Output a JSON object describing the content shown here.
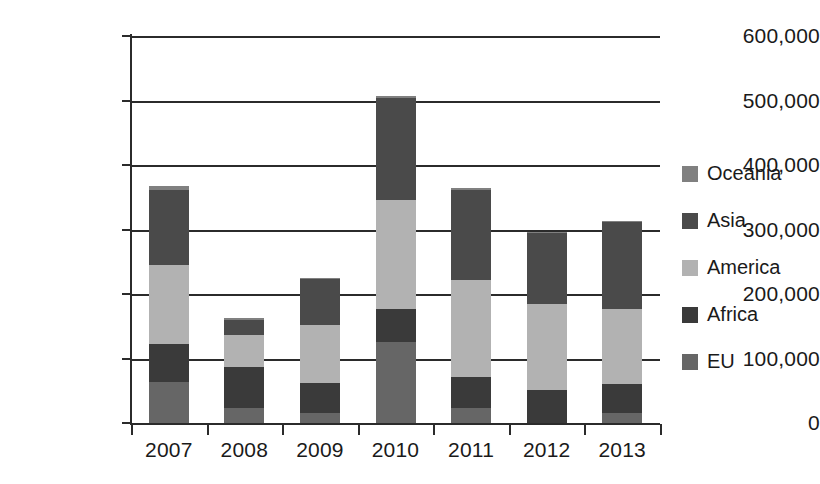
{
  "chart_data": {
    "type": "bar",
    "stacked": true,
    "title": "",
    "xlabel": "",
    "ylabel": "",
    "categories": [
      "2007",
      "2008",
      "2009",
      "2010",
      "2011",
      "2012",
      "2013"
    ],
    "ylim": [
      0,
      600000
    ],
    "yticks": [
      0,
      100000,
      200000,
      300000,
      400000,
      500000,
      600000
    ],
    "ytick_labels": [
      "0",
      "100,000",
      "200,000",
      "300,000",
      "400,000",
      "500,000",
      "600,000"
    ],
    "grid": true,
    "legend_position": "right",
    "series": [
      {
        "name": "EU",
        "color": "#666666",
        "values": [
          63000,
          23000,
          16000,
          125000,
          24000,
          0,
          16000
        ]
      },
      {
        "name": "Africa",
        "color": "#3a3a3a",
        "values": [
          60000,
          64000,
          46000,
          52000,
          47000,
          51000,
          44000
        ]
      },
      {
        "name": "America",
        "color": "#b2b2b2",
        "values": [
          122000,
          50000,
          90000,
          168000,
          150000,
          133000,
          117000
        ]
      },
      {
        "name": "Asia",
        "color": "#4a4a4a",
        "values": [
          116000,
          22000,
          72000,
          159000,
          140000,
          110000,
          134000
        ]
      },
      {
        "name": "Oceania",
        "color": "#808080",
        "values": [
          6000,
          4000,
          1000,
          3000,
          3000,
          2000,
          2000
        ]
      }
    ],
    "totals": [
      367000,
      163000,
      225000,
      507000,
      364000,
      296000,
      313000
    ]
  },
  "legend": {
    "items": [
      {
        "label": "Oceania",
        "color": "#808080"
      },
      {
        "label": "Asia",
        "color": "#4a4a4a"
      },
      {
        "label": "America",
        "color": "#b2b2b2"
      },
      {
        "label": "Africa",
        "color": "#3a3a3a"
      },
      {
        "label": "EU",
        "color": "#666666"
      }
    ]
  }
}
